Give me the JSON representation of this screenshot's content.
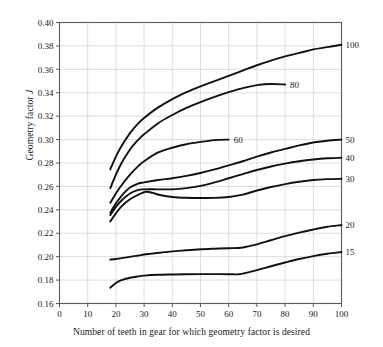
{
  "figure": {
    "ylabel_text": "Geometry factor ",
    "ylabel_symbol": "J",
    "xlabel": "Number of teeth in gear for which geometry factor is desired"
  },
  "chart_data": {
    "type": "line",
    "title": "",
    "subtitle": "",
    "xlabel": "Number of teeth in gear for which geometry factor is desired",
    "ylabel": "Geometry factor J",
    "xlim": [
      0,
      100
    ],
    "ylim": [
      0.16,
      0.4
    ],
    "xticks": [
      0,
      10,
      20,
      30,
      40,
      50,
      60,
      70,
      80,
      90,
      100
    ],
    "yticks": [
      0.16,
      0.18,
      0.2,
      0.22,
      0.24,
      0.26,
      0.28,
      0.3,
      0.32,
      0.34,
      0.36,
      0.38,
      0.4
    ],
    "xtick_labels": [
      "0",
      "10",
      "20",
      "30",
      "40",
      "50",
      "60",
      "70",
      "80",
      "90",
      "100"
    ],
    "ytick_labels": [
      "0.16",
      "0.18",
      "0.20",
      "0.22",
      "0.24",
      "0.26",
      "0.28",
      "0.30",
      "0.32",
      "0.34",
      "0.36",
      "0.38",
      "0.40"
    ],
    "grid": true,
    "legend": "inline-end-labels",
    "legend_title": "Number of teeth in mating gear",
    "series": [
      {
        "name": "100",
        "label": "100",
        "label_position": "right-end",
        "x": [
          18,
          20,
          22,
          25,
          28,
          30,
          35,
          40,
          45,
          50,
          55,
          60,
          65,
          70,
          75,
          80,
          85,
          90,
          95,
          100
        ],
        "values": [
          0.2745,
          0.2855,
          0.2945,
          0.3055,
          0.314,
          0.3185,
          0.3275,
          0.3345,
          0.3405,
          0.3455,
          0.35,
          0.3545,
          0.359,
          0.3635,
          0.3675,
          0.371,
          0.374,
          0.377,
          0.379,
          0.381
        ]
      },
      {
        "name": "80",
        "label": "80",
        "label_position": "inline-end",
        "x": [
          18,
          20,
          22,
          25,
          28,
          30,
          35,
          40,
          45,
          50,
          55,
          60,
          65,
          70,
          75,
          80
        ],
        "values": [
          0.2585,
          0.27,
          0.28,
          0.2915,
          0.3,
          0.3045,
          0.314,
          0.321,
          0.327,
          0.332,
          0.3365,
          0.3405,
          0.344,
          0.3465,
          0.3475,
          0.347
        ]
      },
      {
        "name": "60",
        "label": "60",
        "label_position": "inline-end",
        "x": [
          18,
          20,
          22,
          25,
          28,
          30,
          35,
          40,
          45,
          50,
          55,
          60
        ],
        "values": [
          0.246,
          0.254,
          0.261,
          0.27,
          0.2775,
          0.2815,
          0.289,
          0.293,
          0.296,
          0.298,
          0.2995,
          0.3
        ]
      },
      {
        "name": "50",
        "label": "50",
        "label_position": "right-end",
        "x": [
          18,
          20,
          22,
          25,
          28,
          30,
          35,
          40,
          45,
          50,
          55,
          60,
          65,
          70,
          75,
          80,
          85,
          90,
          95,
          100
        ],
        "values": [
          0.2375,
          0.2455,
          0.252,
          0.259,
          0.2625,
          0.2635,
          0.2655,
          0.267,
          0.269,
          0.2715,
          0.2745,
          0.278,
          0.2815,
          0.2855,
          0.289,
          0.292,
          0.295,
          0.2975,
          0.299,
          0.3
        ]
      },
      {
        "name": "40",
        "label": "40",
        "label_position": "right-end",
        "x": [
          18,
          20,
          22,
          25,
          28,
          30,
          35,
          40,
          45,
          50,
          55,
          60,
          65,
          70,
          75,
          80,
          85,
          90,
          95,
          100
        ],
        "values": [
          0.2355,
          0.2425,
          0.248,
          0.254,
          0.257,
          0.2575,
          0.2575,
          0.2575,
          0.2585,
          0.2605,
          0.2635,
          0.267,
          0.2705,
          0.274,
          0.277,
          0.2795,
          0.2815,
          0.283,
          0.284,
          0.2845
        ]
      },
      {
        "name": "30",
        "label": "30",
        "label_position": "right-end",
        "x": [
          18,
          20,
          22,
          25,
          28,
          30,
          31,
          33,
          36,
          40,
          45,
          50,
          55,
          60,
          65,
          70,
          75,
          80,
          85,
          90,
          95,
          100
        ],
        "values": [
          0.23,
          0.237,
          0.243,
          0.249,
          0.253,
          0.255,
          0.2555,
          0.2545,
          0.2525,
          0.251,
          0.2503,
          0.2501,
          0.2502,
          0.251,
          0.253,
          0.2565,
          0.2595,
          0.262,
          0.264,
          0.2655,
          0.2662,
          0.2665
        ]
      },
      {
        "name": "20",
        "label": "20",
        "label_position": "right-end",
        "x": [
          18,
          20,
          22,
          25,
          28,
          30,
          32,
          36,
          40,
          45,
          50,
          55,
          60,
          63,
          65,
          70,
          75,
          80,
          85,
          90,
          95,
          100
        ],
        "values": [
          0.1975,
          0.198,
          0.1988,
          0.1998,
          0.201,
          0.2018,
          0.2024,
          0.2035,
          0.2045,
          0.2055,
          0.2063,
          0.2068,
          0.2072,
          0.2074,
          0.2078,
          0.2105,
          0.214,
          0.2175,
          0.2205,
          0.2232,
          0.2255,
          0.227
        ]
      },
      {
        "name": "15",
        "label": "15",
        "label_position": "right-end",
        "x": [
          18,
          20,
          22,
          25,
          28,
          30,
          35,
          40,
          45,
          50,
          55,
          60,
          63,
          65,
          70,
          75,
          80,
          85,
          90,
          95,
          100
        ],
        "values": [
          0.1735,
          0.1775,
          0.18,
          0.182,
          0.1832,
          0.1838,
          0.1845,
          0.1848,
          0.185,
          0.1851,
          0.1851,
          0.185,
          0.1849,
          0.1855,
          0.1885,
          0.1918,
          0.195,
          0.198,
          0.2005,
          0.2025,
          0.204
        ]
      }
    ]
  },
  "style": {
    "curve_color": "#111111",
    "grid_color": "#cfcfcf",
    "axis_color": "#5a5a5a",
    "text_color": "#1a1a1a",
    "background": "#ffffff"
  }
}
